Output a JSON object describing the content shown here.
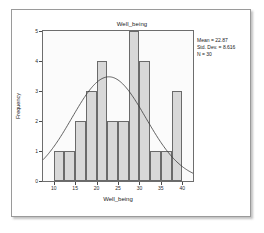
{
  "chart_data": {
    "type": "bar",
    "title": "Well_being",
    "xlabel": "Well_being",
    "ylabel": "Frequency",
    "xlim": [
      7.5,
      42.5
    ],
    "ylim": [
      0,
      5
    ],
    "grid": false,
    "legend_position": "none",
    "bin_width": 2.5,
    "categories": [
      "10.0",
      "12.5",
      "15.0",
      "17.5",
      "20.0",
      "22.5",
      "25.0",
      "27.5",
      "30.0",
      "32.5",
      "35.0",
      "37.5"
    ],
    "bin_starts": [
      10.0,
      12.5,
      15.0,
      17.5,
      20.0,
      22.5,
      25.0,
      27.5,
      30.0,
      32.5,
      35.0,
      37.5
    ],
    "values": [
      1,
      1,
      2,
      3,
      4,
      2,
      2,
      5,
      4,
      1,
      1,
      3
    ],
    "bars": [
      {
        "start": 10.0,
        "end": 12.5,
        "value": 1
      },
      {
        "start": 12.5,
        "end": 15.0,
        "value": 1
      },
      {
        "start": 15.0,
        "end": 17.5,
        "value": 2
      },
      {
        "start": 17.5,
        "end": 20.0,
        "value": 3
      },
      {
        "start": 20.0,
        "end": 22.5,
        "value": 4
      },
      {
        "start": 22.5,
        "end": 25.0,
        "value": 2
      },
      {
        "start": 25.0,
        "end": 27.5,
        "value": 2
      },
      {
        "start": 27.5,
        "end": 30.0,
        "value": 5
      },
      {
        "start": 30.0,
        "end": 32.5,
        "value": 4
      },
      {
        "start": 32.5,
        "end": 35.0,
        "value": 1
      },
      {
        "start": 35.0,
        "end": 37.5,
        "value": 1
      },
      {
        "start": 37.5,
        "end": 40.0,
        "value": 3
      }
    ],
    "xticks": [
      10,
      15,
      20,
      25,
      30,
      35,
      40
    ],
    "yticks": [
      0,
      1,
      2,
      3,
      4,
      5
    ],
    "overlay": {
      "type": "normal-curve",
      "mean": 22.87,
      "std_dev": 8.616,
      "n": 30,
      "color": "#3a3a3a"
    },
    "colors": {
      "bar_fill": "#d8d8d8",
      "bar_edge": "#6a6a6a",
      "plot_background": "#fbfbfb",
      "axis": "#4a4a4a",
      "text": "#1a1a1a"
    }
  },
  "annotation": {
    "mean_label": "Mean = 22.87",
    "std_dev_label": "Std. Dev. = 8.616",
    "n_label": "N = 30"
  }
}
